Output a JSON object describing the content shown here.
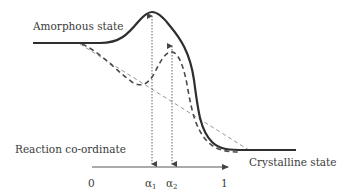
{
  "diagram": {
    "type": "energy-profile",
    "labels": {
      "top_left": "Amorphous state",
      "bottom_left": "Reaction co-ordinate",
      "bottom_right": "Crystalline state"
    },
    "axis": {
      "ticks": [
        {
          "label": "0"
        },
        {
          "label": "α",
          "sub": "1"
        },
        {
          "label": "α",
          "sub": "2"
        },
        {
          "label": "1"
        }
      ]
    },
    "curves": [
      {
        "name": "main-energy-curve",
        "style": "solid"
      },
      {
        "name": "alternative-path-curve",
        "style": "dashed"
      },
      {
        "name": "linear-reference",
        "style": "thin-dashed"
      }
    ],
    "markers": [
      {
        "name": "alpha1-marker",
        "style": "dotted-double-arrow"
      },
      {
        "name": "alpha2-marker",
        "style": "dotted-double-arrow"
      }
    ],
    "colors": {
      "line": "#2e2e2e",
      "dashed": "#555555",
      "thin": "#8a8a8a"
    }
  }
}
